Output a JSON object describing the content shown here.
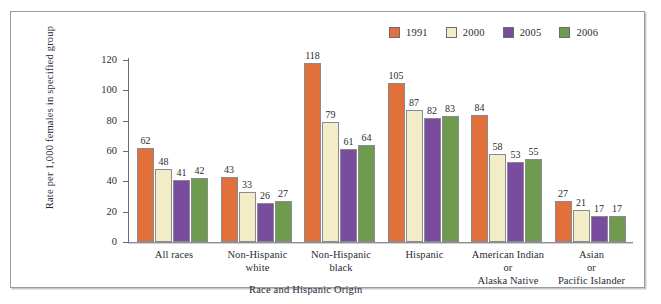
{
  "chart_data": {
    "type": "bar",
    "title": "",
    "xlabel": "Race and Hispanic Origin",
    "ylabel": "Rate per 1,000 females in specified group",
    "ylim": [
      0,
      120
    ],
    "yticks": [
      0,
      20,
      40,
      60,
      80,
      100,
      120
    ],
    "grid": false,
    "legend_position": "top-right",
    "categories": [
      "All races",
      "Non-Hispanic white",
      "Non-Hispanic black",
      "Hispanic",
      "American Indian or Alaska Native",
      "Asian or Pacific Islander"
    ],
    "category_lines": [
      [
        "All races"
      ],
      [
        "Non-Hispanic",
        "white"
      ],
      [
        "Non-Hispanic",
        "black"
      ],
      [
        "Hispanic"
      ],
      [
        "American Indian",
        "or",
        "Alaska Native"
      ],
      [
        "Asian",
        "or",
        "Pacific Islander"
      ]
    ],
    "series": [
      {
        "name": "1991",
        "color": "#E2703A",
        "values": [
          62,
          43,
          118,
          105,
          84,
          27
        ]
      },
      {
        "name": "2000",
        "color": "#F2EDC6",
        "values": [
          48,
          33,
          79,
          87,
          58,
          21
        ]
      },
      {
        "name": "2005",
        "color": "#7A4C9E",
        "values": [
          41,
          26,
          61,
          82,
          53,
          17
        ]
      },
      {
        "name": "2006",
        "color": "#6E9B4E",
        "values": [
          42,
          27,
          64,
          83,
          55,
          17
        ]
      }
    ]
  },
  "legend": {
    "items": [
      {
        "label": "1991",
        "color": "#E2703A"
      },
      {
        "label": "2000",
        "color": "#F2EDC6"
      },
      {
        "label": "2005",
        "color": "#7A4C9E"
      },
      {
        "label": "2006",
        "color": "#6E9B4E"
      }
    ]
  }
}
